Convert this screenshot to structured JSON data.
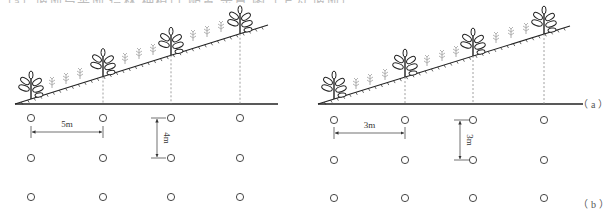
{
  "clipped_caption": "（a）坡地与平地 造林 种植点 配置 示意 图（上为 坡地）",
  "panels": [
    {
      "id": "left",
      "ground": {
        "x1": 15,
        "x2": 278,
        "y": 104
      },
      "slope": {
        "x1": 15,
        "y1": 104,
        "x2": 268,
        "y2": 25
      },
      "trees_x": [
        31,
        103,
        171,
        240
      ],
      "seedlings": [
        [
          52,
          88
        ],
        [
          66,
          84
        ],
        [
          80,
          79
        ],
        [
          125,
          64
        ],
        [
          139,
          59
        ],
        [
          153,
          55
        ],
        [
          193,
          41
        ],
        [
          207,
          37
        ],
        [
          221,
          32
        ]
      ],
      "grid": {
        "cols_x": [
          31,
          103,
          171,
          240
        ],
        "rows_y": [
          118,
          158,
          197
        ]
      },
      "h_dim": {
        "label": "5m",
        "x1": 31,
        "x2": 103,
        "y": 132
      },
      "v_dim": {
        "label": "4m",
        "x": 157,
        "y1": 118,
        "y2": 158
      }
    },
    {
      "id": "right",
      "ground": {
        "x1": 318,
        "x2": 583,
        "y": 104
      },
      "slope": {
        "x1": 318,
        "y1": 104,
        "x2": 570,
        "y2": 26
      },
      "trees_x": [
        334,
        405,
        473,
        544
      ],
      "seedlings": [
        [
          356,
          89
        ],
        [
          370,
          85
        ],
        [
          385,
          80
        ],
        [
          427,
          66
        ],
        [
          442,
          61
        ],
        [
          456,
          57
        ],
        [
          496,
          43
        ],
        [
          511,
          38
        ],
        [
          526,
          34
        ]
      ],
      "grid": {
        "cols_x": [
          334,
          405,
          473,
          544
        ],
        "rows_y": [
          120,
          160,
          198
        ]
      },
      "h_dim": {
        "label": "3m",
        "x1": 334,
        "x2": 405,
        "y": 133
      },
      "v_dim": {
        "label": "3m",
        "x": 460,
        "y1": 120,
        "y2": 160
      }
    }
  ],
  "labels": {
    "a": "（a）",
    "b": "（b）"
  },
  "colors": {
    "line": "#222222",
    "dashed": "#888888",
    "seedling": "#aaaaaa",
    "circle": "#333333"
  }
}
